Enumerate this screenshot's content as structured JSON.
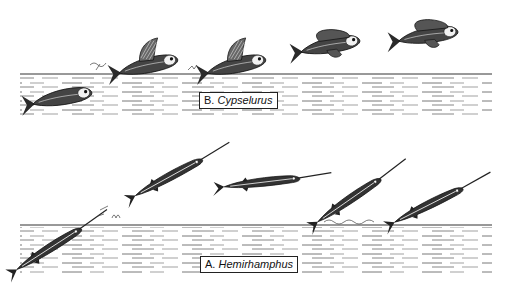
{
  "figure": {
    "panels": [
      {
        "id": "B",
        "letter": "B.",
        "genus": "Cypselurus",
        "description": "Flying fish flight sequence: swimming below surface, taxiing with pectoral fins, then gliding in air",
        "fish_count": 5
      },
      {
        "id": "A",
        "letter": "A.",
        "genus": "Hemirhamphus",
        "description": "Halfbeak leaping sequence: emerging from water, airborne, tail skimming surface",
        "fish_count": 5
      }
    ],
    "colors": {
      "ink": "#222222",
      "background": "#ffffff"
    }
  }
}
